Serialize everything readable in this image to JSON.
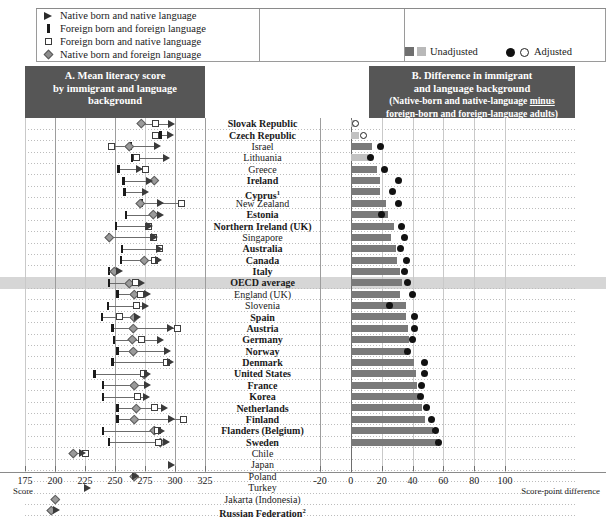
{
  "legend_left": {
    "items": [
      {
        "marker": "filled-triangle-right",
        "label": "Native born and native language"
      },
      {
        "marker": "vertical-bar",
        "label": "Foreign born and foreign language"
      },
      {
        "marker": "open-square",
        "label": "Foreign born and native language"
      },
      {
        "marker": "gray-diamond",
        "label": "Native born and foreign language"
      }
    ]
  },
  "legend_right": {
    "unadjusted_label": "Unadjusted",
    "adjusted_label": "Adjusted"
  },
  "panel_a": {
    "title_line1": "A. Mean literacy score",
    "title_line2": "by immigrant and language background",
    "axis_caption": "Score",
    "ticks": [
      175,
      200,
      225,
      250,
      275,
      300,
      325
    ],
    "xmin": 175,
    "xmax": 325
  },
  "panel_b": {
    "title_line1": "B. Difference in immigrant",
    "title_line2": "and language background",
    "title_line3a": "(Native-born and native-language ",
    "title_line3b": "minus",
    "title_line4": "foreign-born and foreign-language adults)",
    "axis_caption": "Score-point difference",
    "ticks": [
      -20,
      0,
      20,
      40,
      60,
      80,
      100
    ],
    "xmin": -20,
    "xmax": 100
  },
  "chart_data": {
    "type": "bar",
    "xlabel_a": "Score",
    "xlabel_b": "Score-point difference",
    "xlim_a": [
      175,
      325
    ],
    "xlim_b": [
      -20,
      100
    ],
    "grid": true,
    "legend_position": "top",
    "series_names_a": [
      "Native born and native language",
      "Foreign born and foreign language",
      "Foreign born and native language",
      "Native born and foreign language"
    ],
    "series_names_b": [
      "Unadjusted",
      "Adjusted"
    ],
    "categories": [
      "Slovak Republic",
      "Czech Republic",
      "Israel",
      "Lithuania",
      "Greece",
      "Ireland",
      "Cyprus",
      "New Zealand",
      "Estonia",
      "Northern Ireland (UK)",
      "Singapore",
      "Australia",
      "Canada",
      "Italy",
      "OECD average",
      "England (UK)",
      "Slovenia",
      "Spain",
      "Austria",
      "Germany",
      "Norway",
      "Denmark",
      "United States",
      "France",
      "Korea",
      "Netherlands",
      "Finland",
      "Flanders (Belgium)",
      "Sweden",
      "Chile",
      "Japan",
      "Poland",
      "Turkey",
      "Jakarta (Indonesia)",
      "Russian Federation"
    ],
    "rows": [
      {
        "name": "Slovak Republic",
        "bold": true,
        "footnote": "",
        "highlight": false,
        "nb_nl": 297,
        "fb_fl": null,
        "fb_nl": 284,
        "nb_fl": 272,
        "unadj": 2,
        "unadj_light": true,
        "adj": 3,
        "adj_open": true
      },
      {
        "name": "Czech Republic",
        "bold": true,
        "footnote": "",
        "highlight": false,
        "nb_nl": 296,
        "fb_fl": 288,
        "fb_nl": 284,
        "nb_fl": null,
        "unadj": 5,
        "unadj_light": true,
        "adj": 8,
        "adj_open": true
      },
      {
        "name": "Israel",
        "bold": false,
        "footnote": "",
        "highlight": false,
        "nb_nl": 285,
        "fb_fl": 263,
        "fb_nl": 247,
        "nb_fl": 262,
        "unadj": 14,
        "unadj_light": false,
        "adj": 19,
        "adj_open": false
      },
      {
        "name": "Lithuania",
        "bold": false,
        "footnote": "",
        "highlight": false,
        "nb_nl": 293,
        "fb_fl": 264,
        "fb_nl": 268,
        "nb_fl": null,
        "unadj": 11,
        "unadj_light": true,
        "adj": 13,
        "adj_open": false
      },
      {
        "name": "Greece",
        "bold": false,
        "footnote": "",
        "highlight": false,
        "nb_nl": 270,
        "fb_fl": 253,
        "fb_nl": 275,
        "nb_fl": null,
        "unadj": 17,
        "unadj_light": false,
        "adj": 22,
        "adj_open": false
      },
      {
        "name": "Ireland",
        "bold": true,
        "footnote": "",
        "highlight": false,
        "nb_nl": 279,
        "fb_fl": 257,
        "fb_nl": null,
        "nb_fl": 283,
        "unadj": 19,
        "unadj_light": false,
        "adj": 31,
        "adj_open": false
      },
      {
        "name": "Cyprus",
        "bold": true,
        "footnote": "1",
        "highlight": false,
        "nb_nl": 275,
        "fb_fl": 258,
        "fb_nl": null,
        "nb_fl": null,
        "unadj": 19,
        "unadj_light": false,
        "adj": 27,
        "adj_open": false
      },
      {
        "name": "New Zealand",
        "bold": false,
        "footnote": "",
        "highlight": false,
        "nb_nl": 288,
        "fb_fl": 272,
        "fb_nl": 305,
        "nb_fl": 271,
        "unadj": 23,
        "unadj_light": false,
        "adj": 31,
        "adj_open": false
      },
      {
        "name": "Estonia",
        "bold": true,
        "footnote": "",
        "highlight": false,
        "nb_nl": 288,
        "fb_fl": 259,
        "fb_nl": null,
        "nb_fl": 282,
        "unadj": 24,
        "unadj_light": false,
        "adj": 20,
        "adj_open": false
      },
      {
        "name": "Northern Ireland (UK)",
        "bold": true,
        "footnote": "",
        "highlight": false,
        "nb_nl": 279,
        "fb_fl": 251,
        "fb_nl": 278,
        "nb_fl": null,
        "unadj": 28,
        "unadj_light": false,
        "adj": 33,
        "adj_open": false
      },
      {
        "name": "Singapore",
        "bold": false,
        "footnote": "",
        "highlight": false,
        "nb_nl": 283,
        "fb_fl": 245,
        "fb_nl": 282,
        "nb_fl": 245,
        "unadj": 26,
        "unadj_light": false,
        "adj": 35,
        "adj_open": false
      },
      {
        "name": "Australia",
        "bold": true,
        "footnote": "",
        "highlight": false,
        "nb_nl": 287,
        "fb_fl": 256,
        "fb_nl": 287,
        "nb_fl": null,
        "unadj": 29,
        "unadj_light": false,
        "adj": 32,
        "adj_open": false
      },
      {
        "name": "Canada",
        "bold": true,
        "footnote": "",
        "highlight": false,
        "nb_nl": 286,
        "fb_fl": 255,
        "fb_nl": 283,
        "nb_fl": 274,
        "unadj": 30,
        "unadj_light": false,
        "adj": 36,
        "adj_open": false
      },
      {
        "name": "Italy",
        "bold": true,
        "footnote": "",
        "highlight": false,
        "nb_nl": 254,
        "fb_fl": 245,
        "fb_nl": null,
        "nb_fl": 249,
        "unadj": 32,
        "unadj_light": false,
        "adj": 35,
        "adj_open": false
      },
      {
        "name": "OECD average",
        "bold": true,
        "footnote": "",
        "highlight": true,
        "nb_nl": 272,
        "fb_fl": 245,
        "fb_nl": 267,
        "nb_fl": 262,
        "unadj": 33,
        "unadj_light": false,
        "adj": 37,
        "adj_open": false
      },
      {
        "name": "England (UK)",
        "bold": false,
        "footnote": "",
        "highlight": false,
        "nb_nl": 277,
        "fb_fl": 252,
        "fb_nl": 271,
        "nb_fl": 266,
        "unadj": 32,
        "unadj_light": false,
        "adj": 40,
        "adj_open": false
      },
      {
        "name": "Slovenia",
        "bold": false,
        "footnote": "",
        "highlight": false,
        "nb_nl": 275,
        "fb_fl": 244,
        "fb_nl": 268,
        "nb_fl": null,
        "unadj": 36,
        "unadj_light": false,
        "adj": 25,
        "adj_open": false
      },
      {
        "name": "Spain",
        "bold": true,
        "footnote": "",
        "highlight": false,
        "nb_nl": 269,
        "fb_fl": 239,
        "fb_nl": 254,
        "nb_fl": 266,
        "unadj": 36,
        "unadj_light": false,
        "adj": 41,
        "adj_open": false
      },
      {
        "name": "Austria",
        "bold": true,
        "footnote": "",
        "highlight": false,
        "nb_nl": 296,
        "fb_fl": 248,
        "fb_nl": 302,
        "nb_fl": 265,
        "unadj": 37,
        "unadj_light": false,
        "adj": 41,
        "adj_open": false
      },
      {
        "name": "Germany",
        "bold": true,
        "footnote": "",
        "highlight": false,
        "nb_nl": 288,
        "fb_fl": 249,
        "fb_nl": 272,
        "nb_fl": 264,
        "unadj": 38,
        "unadj_light": false,
        "adj": 40,
        "adj_open": false
      },
      {
        "name": "Norway",
        "bold": true,
        "footnote": "",
        "highlight": false,
        "nb_nl": 294,
        "fb_fl": 252,
        "fb_nl": null,
        "nb_fl": 265,
        "unadj": 36,
        "unadj_light": false,
        "adj": 37,
        "adj_open": false
      },
      {
        "name": "Denmark",
        "bold": true,
        "footnote": "",
        "highlight": false,
        "nb_nl": 296,
        "fb_fl": 248,
        "fb_nl": 293,
        "nb_fl": null,
        "unadj": 41,
        "unadj_light": false,
        "adj": 48,
        "adj_open": false
      },
      {
        "name": "United States",
        "bold": true,
        "footnote": "",
        "highlight": false,
        "nb_nl": 277,
        "fb_fl": 233,
        "fb_nl": 274,
        "nb_fl": 274,
        "unadj": 42,
        "unadj_light": false,
        "adj": 48,
        "adj_open": false
      },
      {
        "name": "France",
        "bold": true,
        "footnote": "",
        "highlight": false,
        "nb_nl": 277,
        "fb_fl": 240,
        "fb_nl": null,
        "nb_fl": 266,
        "unadj": 43,
        "unadj_light": false,
        "adj": 46,
        "adj_open": false
      },
      {
        "name": "Korea",
        "bold": true,
        "footnote": "",
        "highlight": false,
        "nb_nl": 276,
        "fb_fl": 240,
        "fb_nl": 269,
        "nb_fl": null,
        "unadj": 44,
        "unadj_light": false,
        "adj": 45,
        "adj_open": false
      },
      {
        "name": "Netherlands",
        "bold": true,
        "footnote": "",
        "highlight": false,
        "nb_nl": 291,
        "fb_fl": 252,
        "fb_nl": 283,
        "nb_fl": 268,
        "unadj": 46,
        "unadj_light": false,
        "adj": 49,
        "adj_open": false
      },
      {
        "name": "Finland",
        "bold": true,
        "footnote": "",
        "highlight": false,
        "nb_nl": 297,
        "fb_fl": 252,
        "fb_nl": 307,
        "nb_fl": 266,
        "unadj": 48,
        "unadj_light": false,
        "adj": 52,
        "adj_open": false
      },
      {
        "name": "Flanders (Belgium)",
        "bold": true,
        "footnote": "",
        "highlight": false,
        "nb_nl": 289,
        "fb_fl": 240,
        "fb_nl": 285,
        "nb_fl": 283,
        "unadj": 53,
        "unadj_light": false,
        "adj": 55,
        "adj_open": false
      },
      {
        "name": "Sweden",
        "bold": true,
        "footnote": "",
        "highlight": false,
        "nb_nl": 293,
        "fb_fl": 245,
        "fb_nl": 286,
        "nb_fl": 288,
        "unadj": 56,
        "unadj_light": false,
        "adj": 57,
        "adj_open": false
      },
      {
        "name": "Chile",
        "bold": false,
        "footnote": "",
        "highlight": false,
        "nb_nl": 223,
        "fb_fl": null,
        "fb_nl": 225,
        "nb_fl": 215,
        "unadj": null,
        "unadj_light": false,
        "adj": null,
        "adj_open": false
      },
      {
        "name": "Japan",
        "bold": false,
        "footnote": "",
        "highlight": false,
        "nb_nl": 297,
        "fb_fl": null,
        "fb_nl": null,
        "nb_fl": null,
        "unadj": null,
        "unadj_light": false,
        "adj": null,
        "adj_open": false
      },
      {
        "name": "Poland",
        "bold": false,
        "footnote": "",
        "highlight": false,
        "nb_nl": 267,
        "fb_fl": null,
        "fb_nl": null,
        "nb_fl": 266,
        "unadj": null,
        "unadj_light": false,
        "adj": null,
        "adj_open": false
      },
      {
        "name": "Turkey",
        "bold": false,
        "footnote": "",
        "highlight": false,
        "nb_nl": 227,
        "fb_fl": null,
        "fb_nl": null,
        "nb_fl": null,
        "unadj": null,
        "unadj_light": false,
        "adj": null,
        "adj_open": false
      },
      {
        "name": "Jakarta (Indonesia)",
        "bold": false,
        "footnote": "",
        "highlight": false,
        "nb_nl": null,
        "fb_fl": null,
        "fb_nl": null,
        "nb_fl": 200,
        "unadj": null,
        "unadj_light": false,
        "adj": null,
        "adj_open": false
      },
      {
        "name": "Russian Federation",
        "bold": true,
        "footnote": "2",
        "highlight": false,
        "nb_nl": 201,
        "fb_fl": null,
        "fb_nl": null,
        "nb_fl": 197,
        "unadj": null,
        "unadj_light": false,
        "adj": null,
        "adj_open": false
      }
    ]
  }
}
